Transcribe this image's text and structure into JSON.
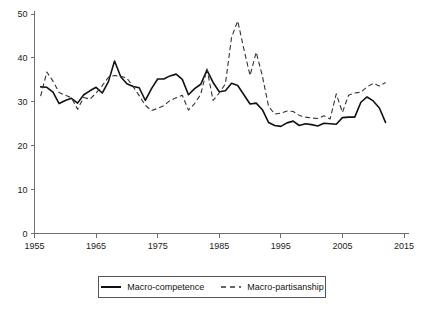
{
  "chart_data": {
    "type": "line",
    "title": "",
    "xlabel": "",
    "ylabel": "",
    "xlim": [
      1955,
      2015
    ],
    "ylim": [
      0,
      50
    ],
    "grid": false,
    "x_ticks": [
      1955,
      1965,
      1975,
      1985,
      1995,
      2005,
      2015
    ],
    "y_ticks": [
      0,
      10,
      20,
      30,
      40,
      50
    ],
    "legend_position": "below-center",
    "x": [
      1956,
      1957,
      1958,
      1959,
      1960,
      1961,
      1962,
      1963,
      1964,
      1965,
      1966,
      1967,
      1968,
      1969,
      1970,
      1971,
      1972,
      1973,
      1974,
      1975,
      1976,
      1977,
      1978,
      1979,
      1980,
      1981,
      1982,
      1983,
      1984,
      1985,
      1986,
      1987,
      1988,
      1989,
      1990,
      1991,
      1992,
      1993,
      1994,
      1995,
      1996,
      1997,
      1998,
      1999,
      2000,
      2001,
      2002,
      2003,
      2004,
      2005,
      2006,
      2007,
      2008,
      2009,
      2010,
      2011,
      2012
    ],
    "series": [
      {
        "name": "Macro-competence",
        "style": "solid",
        "color": "#111111",
        "values": [
          33.4,
          33.3,
          32.2,
          29.6,
          30.3,
          30.8,
          29.7,
          31.6,
          32.5,
          33.3,
          32.0,
          34.6,
          39.3,
          35.7,
          34.1,
          33.5,
          33.2,
          30.3,
          33.0,
          35.2,
          35.2,
          35.9,
          36.3,
          35.1,
          31.6,
          33.0,
          34.0,
          37.2,
          34.4,
          32.3,
          32.5,
          34.2,
          33.7,
          31.6,
          29.5,
          29.7,
          28.2,
          25.3,
          24.6,
          24.4,
          25.2,
          25.6,
          24.6,
          25.0,
          24.8,
          24.5,
          25.1,
          25.0,
          24.9,
          26.4,
          26.5,
          26.5,
          29.9,
          31.1,
          30.2,
          28.6,
          25.3
        ]
      },
      {
        "name": "Macro-partisanship",
        "style": "dashed",
        "color": "#333333",
        "values": [
          31.3,
          36.8,
          34.7,
          32.1,
          31.5,
          30.9,
          28.3,
          31.0,
          30.6,
          32.0,
          33.7,
          35.6,
          36.0,
          35.8,
          35.4,
          33.5,
          31.4,
          29.2,
          28.0,
          28.5,
          29.1,
          30.3,
          30.9,
          31.5,
          28.1,
          29.6,
          31.7,
          37.5,
          30.3,
          32.0,
          34.1,
          44.7,
          48.4,
          42.0,
          36.0,
          41.3,
          35.9,
          29.0,
          27.2,
          27.4,
          27.9,
          27.8,
          26.9,
          26.5,
          26.3,
          26.2,
          26.8,
          26.1,
          31.8,
          27.6,
          31.5,
          32.0,
          32.2,
          33.4,
          34.2,
          33.6,
          34.4
        ]
      }
    ]
  },
  "legend": {
    "items": [
      {
        "label": "Macro-competence",
        "style": "solid"
      },
      {
        "label": "Macro-partisanship",
        "style": "dashed"
      }
    ]
  }
}
